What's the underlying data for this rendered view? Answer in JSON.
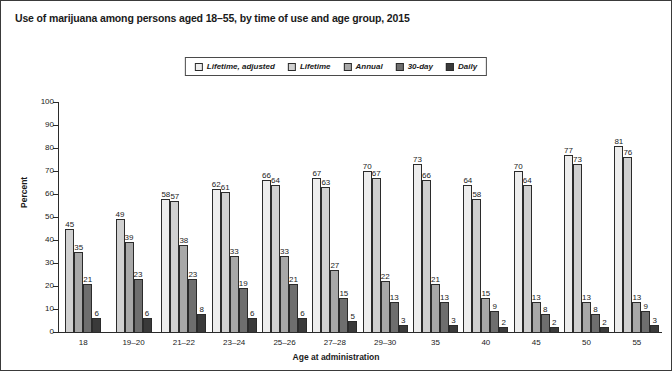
{
  "title": "Use of marijuana among persons aged 18–55, by time of use and age group, 2015",
  "legend": {
    "items": [
      {
        "label": "Lifetime, adjusted",
        "color": "#ededed"
      },
      {
        "label": "Lifetime",
        "color": "#d0d0d0"
      },
      {
        "label": "Annual",
        "color": "#a8a8a8"
      },
      {
        "label": "30-day",
        "color": "#6e6e6e"
      },
      {
        "label": "Daily",
        "color": "#3a3a3a"
      }
    ]
  },
  "chart_data": {
    "type": "bar",
    "title": "Use of marijuana among persons aged 18–55, by time of use and age group, 2015",
    "xlabel": "Age at administration",
    "ylabel": "Percent",
    "ylim": [
      0,
      100
    ],
    "yticks": [
      0,
      10,
      20,
      30,
      40,
      50,
      60,
      70,
      80,
      90,
      100
    ],
    "grid": false,
    "legend_position": "top-center",
    "categories": [
      "18",
      "19–20",
      "21–22",
      "23–24",
      "25–26",
      "27–28",
      "29–30",
      "35",
      "40",
      "45",
      "50",
      "55"
    ],
    "series": [
      {
        "name": "Lifetime, adjusted",
        "color": "#ededed",
        "values": [
          null,
          null,
          58,
          62,
          66,
          67,
          70,
          73,
          64,
          70,
          77,
          81
        ]
      },
      {
        "name": "Lifetime",
        "color": "#d0d0d0",
        "values": [
          45,
          49,
          57,
          61,
          64,
          63,
          67,
          66,
          58,
          64,
          73,
          76
        ]
      },
      {
        "name": "Annual",
        "color": "#a8a8a8",
        "values": [
          35,
          39,
          38,
          33,
          33,
          27,
          22,
          21,
          15,
          13,
          13,
          13
        ]
      },
      {
        "name": "30-day",
        "color": "#6e6e6e",
        "values": [
          21,
          23,
          23,
          19,
          21,
          15,
          13,
          13,
          9,
          8,
          8,
          9
        ]
      },
      {
        "name": "Daily",
        "color": "#3a3a3a",
        "values": [
          6,
          6,
          8,
          6,
          6,
          5,
          3,
          3,
          2,
          2,
          2,
          3
        ]
      }
    ]
  }
}
